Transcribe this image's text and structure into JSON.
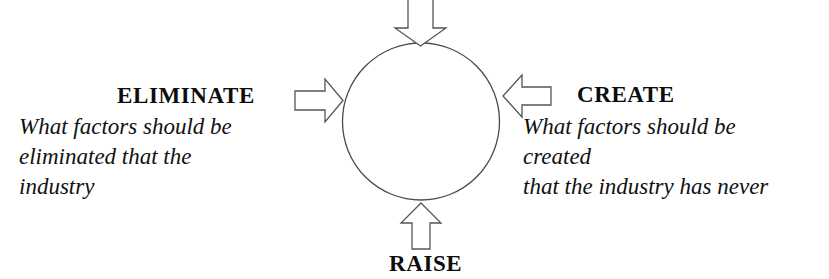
{
  "diagram": {
    "type": "four-actions-framework",
    "center_shape": "circle",
    "background_color": "#ffffff",
    "stroke_color": "#4a4a4a",
    "text_color": "#0d0d0d",
    "quadrants": {
      "left": {
        "heading": "ELIMINATE",
        "arrow_direction": "right",
        "description_lines": [
          "What factors should be",
          "eliminated that the",
          "industry"
        ]
      },
      "right": {
        "heading": "CREATE",
        "arrow_direction": "left",
        "description_lines": [
          "What factors should be",
          "created",
          "that the industry has never"
        ]
      },
      "bottom": {
        "heading": "RAISE",
        "arrow_direction": "up",
        "description_lines": []
      },
      "top": {
        "heading": "",
        "arrow_direction": "down",
        "description_lines": []
      }
    }
  }
}
